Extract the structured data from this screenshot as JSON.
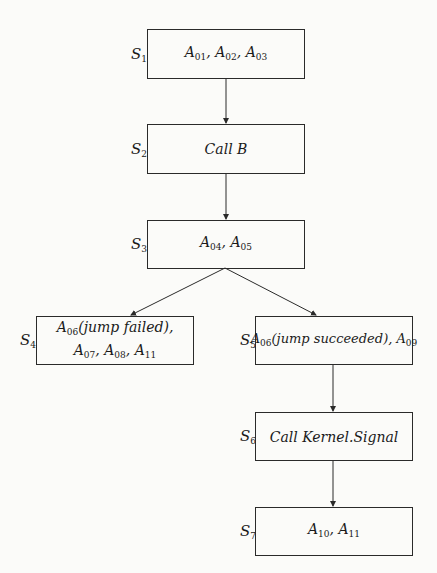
{
  "diagram": {
    "type": "flowchart",
    "direction": "top-to-bottom",
    "nodes": [
      {
        "id": "S1",
        "state": "S",
        "sub": "1",
        "label_parts": [
          [
            "A",
            "01"
          ],
          ", ",
          [
            "A",
            "02"
          ],
          ", ",
          [
            "A",
            "03"
          ]
        ],
        "text": "A01, A02, A03"
      },
      {
        "id": "S2",
        "state": "S",
        "sub": "2",
        "text": "Call B"
      },
      {
        "id": "S3",
        "state": "S",
        "sub": "3",
        "label_parts": [
          [
            "A",
            "04"
          ],
          ", ",
          [
            "A",
            "05"
          ]
        ],
        "text": "A04, A05"
      },
      {
        "id": "S4",
        "state": "S",
        "sub": "4",
        "text": "A06(jump failed), A07, A08, A11"
      },
      {
        "id": "S5",
        "state": "S",
        "sub": "5",
        "text": "A06(jump succeeded), A09"
      },
      {
        "id": "S6",
        "state": "S",
        "sub": "6",
        "text": "Call Kernel.Signal"
      },
      {
        "id": "S7",
        "state": "S",
        "sub": "7",
        "text": "A10, A11"
      }
    ],
    "edges": [
      {
        "from": "S1",
        "to": "S2"
      },
      {
        "from": "S2",
        "to": "S3"
      },
      {
        "from": "S3",
        "to": "S4"
      },
      {
        "from": "S3",
        "to": "S5"
      },
      {
        "from": "S5",
        "to": "S6"
      },
      {
        "from": "S6",
        "to": "S7"
      }
    ],
    "colors": {
      "line": "#2a2a2a",
      "background": "#fbfbf9"
    }
  }
}
